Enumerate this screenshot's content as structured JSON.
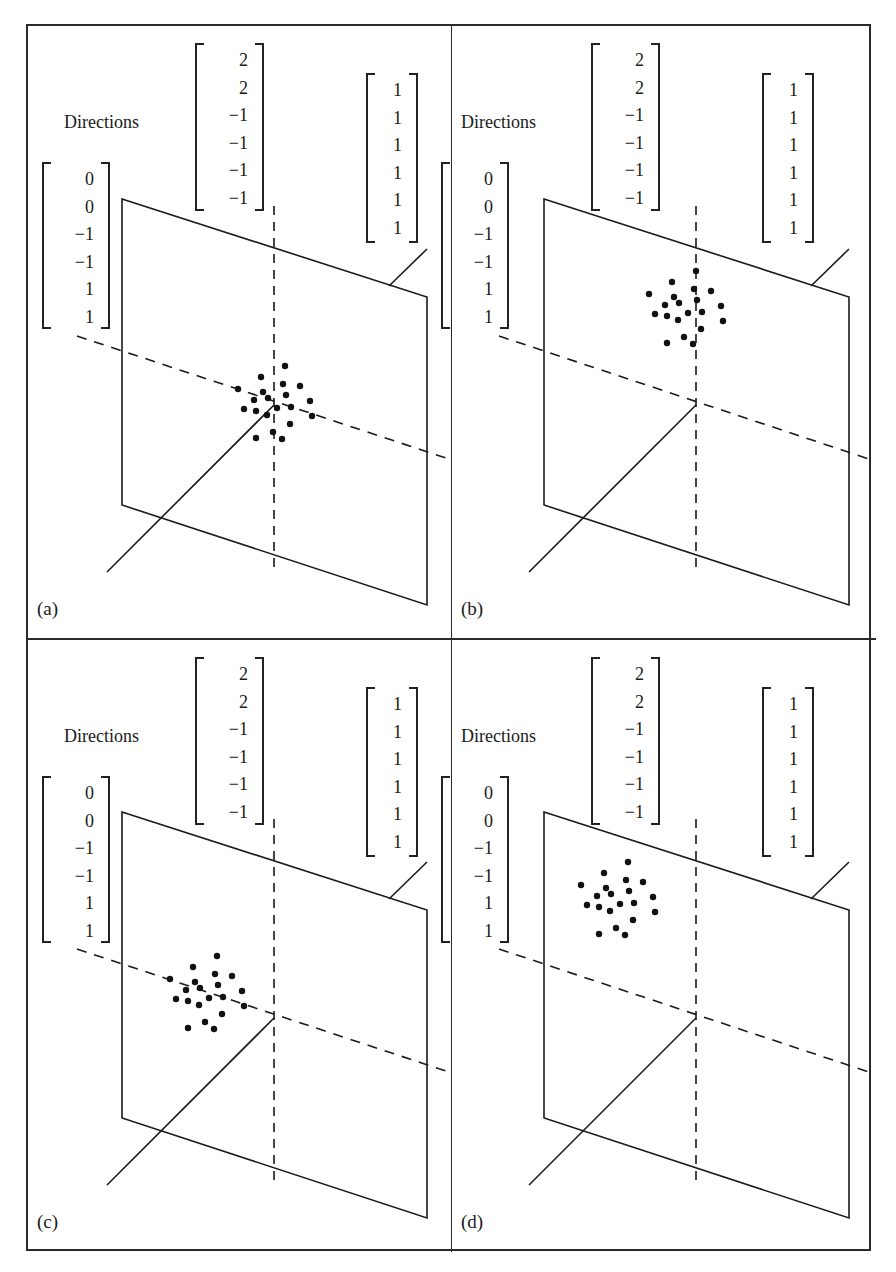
{
  "figure": {
    "directions_label": "Directions",
    "vectors": {
      "left": [
        "0",
        "0",
        "−1",
        "−1",
        "1",
        "1"
      ],
      "middle": [
        "2",
        "2",
        "−1",
        "−1",
        "−1",
        "−1"
      ],
      "right": [
        "1",
        "1",
        "1",
        "1",
        "1",
        "1"
      ]
    },
    "panels": [
      {
        "tag": "(a)",
        "cluster_position": "centered on axes origin"
      },
      {
        "tag": "(b)",
        "cluster_position": "shifted up along vertical axis"
      },
      {
        "tag": "(c)",
        "cluster_position": "shifted left along dashed diagonal axis"
      },
      {
        "tag": "(d)",
        "cluster_position": "shifted up and left"
      }
    ],
    "caption_fragment": ""
  },
  "colors": {
    "ink": "#1a1a1a",
    "paper": "#ffffff",
    "frame": "#2a2a2a"
  }
}
